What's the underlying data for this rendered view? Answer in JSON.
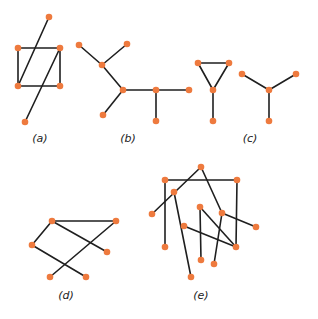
{
  "colors": {
    "node": "#ee7a3e",
    "edge": "#1f1f1f",
    "accent_edge": "#2a2a6a"
  },
  "graphs": [
    {
      "id": "a",
      "label": "(a)",
      "label_pos": [
        40,
        142
      ],
      "nodes": [
        [
          49,
          17
        ],
        [
          18,
          48
        ],
        [
          60,
          48
        ],
        [
          18,
          86
        ],
        [
          60,
          86
        ],
        [
          25,
          122
        ]
      ],
      "edges": [
        [
          1,
          2
        ],
        [
          2,
          4
        ],
        [
          4,
          3
        ],
        [
          3,
          1
        ],
        [
          0,
          3
        ],
        [
          2,
          5
        ]
      ]
    },
    {
      "id": "b",
      "label": "(b)",
      "label_pos": [
        128,
        142
      ],
      "nodes": [
        [
          79,
          45
        ],
        [
          127,
          44
        ],
        [
          102,
          65
        ],
        [
          123,
          90
        ],
        [
          103,
          115
        ],
        [
          156,
          90
        ],
        [
          189,
          90
        ],
        [
          156,
          121
        ]
      ],
      "edges": [
        [
          0,
          2
        ],
        [
          1,
          2
        ],
        [
          2,
          3
        ],
        [
          3,
          4
        ],
        [
          3,
          5
        ],
        [
          5,
          6
        ],
        [
          5,
          7
        ]
      ]
    },
    {
      "id": "c",
      "label": "(c)",
      "label_pos": [
        250,
        142
      ],
      "nodes": [
        [
          198,
          63
        ],
        [
          229,
          63
        ],
        [
          213,
          90
        ],
        [
          213,
          121
        ],
        [
          242,
          74
        ],
        [
          296,
          74
        ],
        [
          269,
          90
        ],
        [
          269,
          121
        ]
      ],
      "edges": [
        [
          0,
          1
        ],
        [
          0,
          2
        ],
        [
          1,
          2
        ],
        [
          2,
          3
        ],
        [
          4,
          6
        ],
        [
          5,
          6
        ],
        [
          6,
          7
        ]
      ]
    },
    {
      "id": "d",
      "label": "(d)",
      "label_pos": [
        66,
        299
      ],
      "nodes": [
        [
          52,
          221
        ],
        [
          116,
          221
        ],
        [
          32,
          245
        ],
        [
          107,
          252
        ],
        [
          50,
          277
        ],
        [
          86,
          277
        ]
      ],
      "edges": [
        [
          0,
          1
        ],
        [
          0,
          2
        ],
        [
          0,
          3
        ],
        [
          1,
          4
        ],
        [
          2,
          5
        ]
      ]
    },
    {
      "id": "e",
      "label": "(e)",
      "label_pos": [
        201,
        299
      ],
      "nodes": [
        [
          201,
          167
        ],
        [
          165,
          180
        ],
        [
          237,
          180
        ],
        [
          174,
          192
        ],
        [
          152,
          214
        ],
        [
          200,
          207
        ],
        [
          222,
          213
        ],
        [
          256,
          227
        ],
        [
          184,
          226
        ],
        [
          165,
          247
        ],
        [
          236,
          247
        ],
        [
          201,
          260
        ],
        [
          214,
          264
        ],
        [
          191,
          277
        ]
      ],
      "edges": [
        [
          1,
          2
        ],
        [
          1,
          9
        ],
        [
          2,
          10
        ],
        [
          0,
          4
        ],
        [
          0,
          6
        ],
        [
          6,
          7
        ],
        [
          6,
          12
        ],
        [
          5,
          11
        ],
        [
          5,
          10
        ],
        [
          8,
          10
        ],
        [
          3,
          13
        ]
      ]
    }
  ]
}
